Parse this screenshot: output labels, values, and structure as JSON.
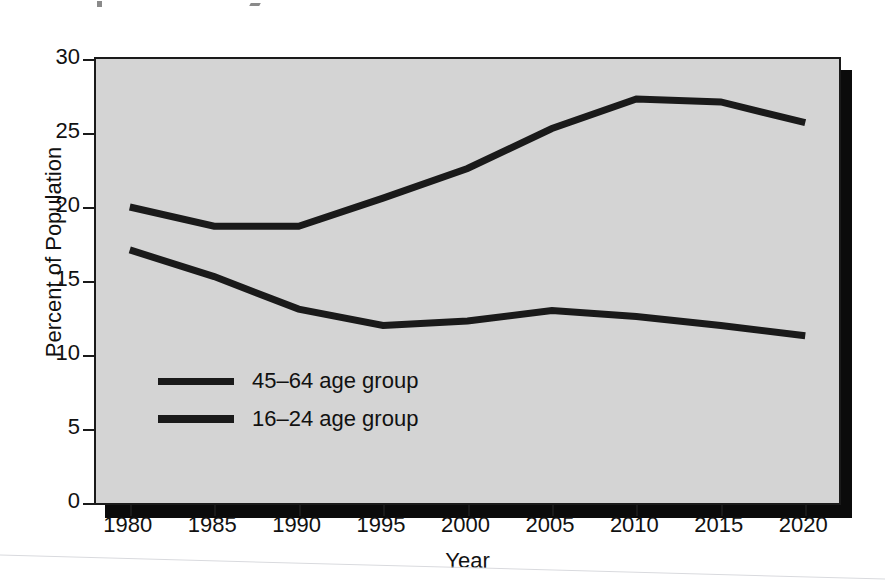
{
  "figure": {
    "background_color": "#ffffff",
    "plot_background_color": "#d4d4d4",
    "line_color": "#1a1a1a",
    "shadow_color": "#0b0b0b"
  },
  "axes": {
    "x_title": "Year",
    "y_title": "Percent of Population",
    "x_ticks": [
      "1980",
      "1985",
      "1990",
      "1995",
      "2000",
      "2005",
      "2010",
      "2015",
      "2020"
    ],
    "y_ticks": [
      "0",
      "5",
      "10",
      "15",
      "20",
      "25",
      "30"
    ]
  },
  "legend": {
    "items": [
      {
        "label": "45–64 age group",
        "swatch": "line-swatch-45-64"
      },
      {
        "label": "16–24 age group",
        "swatch": "line-swatch-16-24"
      }
    ]
  },
  "chart_data": {
    "type": "line",
    "title": "",
    "subtitle": "",
    "xlabel": "Year",
    "ylabel": "Percent of Population",
    "x": [
      1980,
      1985,
      1990,
      1995,
      2000,
      2005,
      2010,
      2015,
      2020
    ],
    "xlim": [
      1978,
      2022
    ],
    "ylim": [
      0,
      30
    ],
    "y_ticks": [
      0,
      5,
      10,
      15,
      20,
      25,
      30
    ],
    "x_ticks": [
      1980,
      1985,
      1990,
      1995,
      2000,
      2005,
      2010,
      2015,
      2020
    ],
    "grid": false,
    "legend_position": "inside-lower-left",
    "series": [
      {
        "name": "45–64 age group",
        "values": [
          20.0,
          18.7,
          18.7,
          20.6,
          22.6,
          25.3,
          27.3,
          27.1,
          25.7
        ],
        "color": "#1a1a1a",
        "line_width": 7
      },
      {
        "name": "16–24 age group",
        "values": [
          17.1,
          15.3,
          13.1,
          12.0,
          12.3,
          13.0,
          12.6,
          12.0,
          11.3
        ],
        "color": "#1a1a1a",
        "line_width": 7
      }
    ]
  }
}
